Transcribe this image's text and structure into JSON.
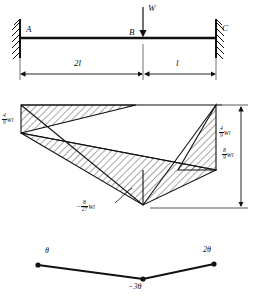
{
  "figure": {
    "ink_color": "#111111",
    "hatch_color": "#222222",
    "background": "#ffffff"
  },
  "beam": {
    "support_left_label": "A",
    "support_right_label": "C",
    "load_point_label": "B",
    "load_label": "W",
    "span_left_label": "2l",
    "span_right_label": "l"
  },
  "moment_diagram": {
    "left_moment_label_num": "4",
    "left_moment_label_den": "9",
    "left_moment_label_unit": "Wl",
    "right_moment_label_num": "4",
    "right_moment_label_den": "9",
    "right_moment_label_unit": "Wl",
    "total_moment_label_num": "8",
    "total_moment_label_den": "9",
    "total_moment_label_unit": "Wl",
    "sagging_moment_sign": "−",
    "sagging_moment_num": "8",
    "sagging_moment_den": "27",
    "sagging_moment_unit": "Wl"
  },
  "slope_diagram": {
    "left_label": "θ",
    "middle_label": "−3θ",
    "right_label": "2θ"
  }
}
